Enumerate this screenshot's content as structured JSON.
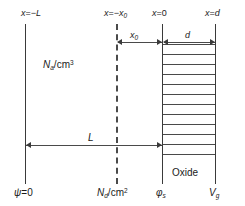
{
  "figure": {
    "axis_labels": {
      "left_top": "x = −L",
      "depletion_top": "x = −x₀",
      "origin_top": "x = 0",
      "oxide_top": "x = d"
    },
    "region_labels": {
      "bulk_doping": "Nₐ /cm³",
      "oxide": "Oxide"
    },
    "bottom_labels": {
      "left": "ψ = 0",
      "depletion": "Nₑ /cm²",
      "origin": "φₛ",
      "right": "Vₑ"
    },
    "dimension_labels": {
      "x0": "x₀",
      "d": "d",
      "L": "L"
    },
    "parts": {
      "left_boundary": {
        "prefix": "x",
        "equals": "=",
        "value": "−L"
      },
      "depletion_boundary": {
        "prefix": "x",
        "equals": "=",
        "value": "−x",
        "subscript": "0"
      },
      "origin_boundary": {
        "prefix": "x",
        "equals": "=",
        "value": "0"
      },
      "oxide_boundary": {
        "prefix": "x",
        "equals": "=",
        "value": "d"
      },
      "bulk": {
        "symbol": "N",
        "subscript": "a",
        "units": "/cm",
        "exponent": "3"
      },
      "sheet": {
        "symbol": "N",
        "subscript": "d",
        "units": "/cm",
        "exponent": "2"
      },
      "psi": {
        "symbol": "ψ",
        "equals": "=",
        "value": "0"
      },
      "phi_s": {
        "symbol": "φ",
        "subscript": "s"
      },
      "vg": {
        "symbol": "V",
        "subscript": "g"
      },
      "x0_dim": {
        "symbol": "x",
        "subscript": "0"
      },
      "d_dim": {
        "symbol": "d"
      },
      "L_dim": {
        "symbol": "L"
      }
    },
    "colors": {
      "line": "#3a3a3a",
      "dash": "#4a4a4a",
      "text": "#1a1a1a",
      "background": "#ffffff"
    },
    "geometry": {
      "hatch_count": 12,
      "oxide_label_position": "bottom-inside"
    }
  }
}
